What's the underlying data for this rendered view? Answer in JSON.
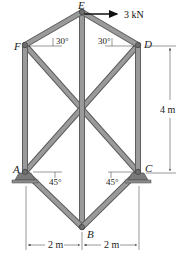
{
  "figure": {
    "joints": [
      {
        "name": "E",
        "x": 82,
        "y": 12
      },
      {
        "name": "F",
        "x": 25,
        "y": 45
      },
      {
        "name": "D",
        "x": 138,
        "y": 45
      },
      {
        "name": "A",
        "x": 25,
        "y": 172
      },
      {
        "name": "C",
        "x": 138,
        "y": 172
      },
      {
        "name": "B",
        "x": 82,
        "y": 227
      }
    ],
    "members": [
      [
        "F",
        "E"
      ],
      [
        "E",
        "D"
      ],
      [
        "F",
        "A"
      ],
      [
        "D",
        "C"
      ],
      [
        "E",
        "B"
      ],
      [
        "F",
        "C"
      ],
      [
        "D",
        "A"
      ],
      [
        "A",
        "B"
      ],
      [
        "C",
        "B"
      ]
    ],
    "labels": {
      "E": "E",
      "F": "F",
      "D": "D",
      "A": "A",
      "C": "C",
      "B": "B"
    },
    "load": {
      "label": "3 kN",
      "joint": "E",
      "direction": "right"
    },
    "angles": {
      "F_top": "30°",
      "D_top": "30°",
      "A_bottom": "45°",
      "C_bottom": "45°"
    },
    "dimensions": {
      "height": "4 m",
      "left_span": "2 m",
      "right_span": "2 m"
    },
    "colors": {
      "member_fill": "#9a9a9a",
      "member_edge": "#5e5e5e",
      "support": "#7a7a7a",
      "ink": "#222222"
    }
  }
}
